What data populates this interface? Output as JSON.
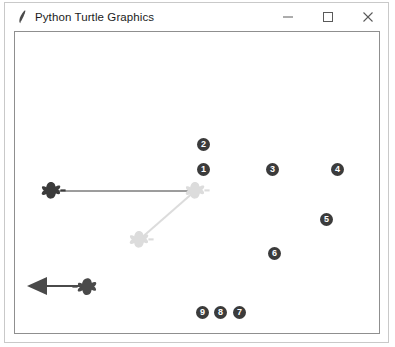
{
  "window": {
    "title": "Python Turtle Graphics",
    "icon": "python-feather-icon",
    "controls": {
      "minimize": "minimize-icon",
      "maximize": "maximize-icon",
      "close": "close-icon"
    },
    "chrome_color": "#c9c9c9",
    "background": "#ffffff"
  },
  "canvas": {
    "background": "#ffffff",
    "border_color": "#8f8f8f",
    "dark_color": "#3b3b3b",
    "light_color": "#d7d7d7",
    "turtles": [
      {
        "id": "turtle-a",
        "shape": "turtle",
        "x": 36,
        "y": 159,
        "heading": 0,
        "color": "#3b3b3b"
      },
      {
        "id": "turtle-b",
        "shape": "turtle",
        "x": 180,
        "y": 159,
        "heading": 0,
        "color": "#d7d7d7"
      },
      {
        "id": "turtle-c",
        "shape": "turtle",
        "x": 124,
        "y": 208,
        "heading": 0,
        "color": "#d7d7d7"
      },
      {
        "id": "turtle-d",
        "shape": "turtle",
        "x": 72,
        "y": 254,
        "heading": 180,
        "color": "#3b3b3b"
      },
      {
        "id": "turtle-e",
        "shape": "arrow",
        "x": 22,
        "y": 254,
        "heading": 180,
        "color": "#3b3b3b"
      }
    ],
    "paths": [
      {
        "id": "path-horizontal",
        "from": [
          40,
          159
        ],
        "to": [
          180,
          159
        ],
        "color": "#3b3b3b",
        "width": 1
      },
      {
        "id": "path-diagonal",
        "from": [
          180,
          159
        ],
        "to": [
          124,
          208
        ],
        "color": "#d7d7d7",
        "width": 2
      },
      {
        "id": "path-bottom",
        "from": [
          72,
          254
        ],
        "to": [
          30,
          254
        ],
        "color": "#3b3b3b",
        "width": 2
      }
    ],
    "badges": [
      {
        "label": "1",
        "x": 197,
        "y": 162
      },
      {
        "label": "2",
        "x": 197,
        "y": 137
      },
      {
        "label": "3",
        "x": 266,
        "y": 162
      },
      {
        "label": "4",
        "x": 331,
        "y": 162
      },
      {
        "label": "5",
        "x": 320,
        "y": 212
      },
      {
        "label": "6",
        "x": 268,
        "y": 246
      },
      {
        "label": "7",
        "x": 233,
        "y": 305
      },
      {
        "label": "8",
        "x": 214,
        "y": 305
      },
      {
        "label": "9",
        "x": 196,
        "y": 305
      }
    ]
  }
}
